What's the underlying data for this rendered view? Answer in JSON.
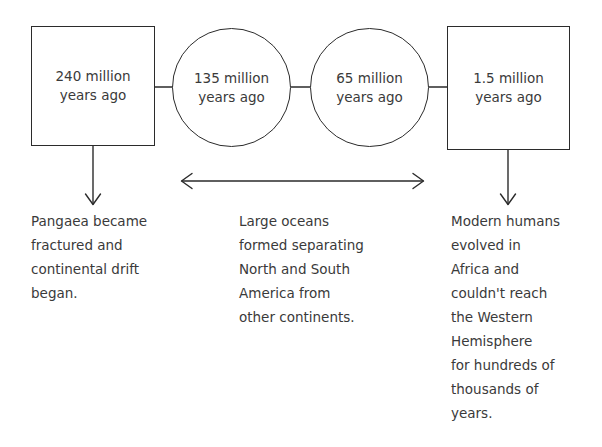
{
  "diagram": {
    "background_color": "#ffffff",
    "stroke_color": "#2b2b2b",
    "text_color": "#3a3a3a",
    "nodes": [
      {
        "id": "node-240-million",
        "shape": "box",
        "line1": "240 million",
        "line2": "years ago",
        "value": 240,
        "unit": "million years ago"
      },
      {
        "id": "node-135-million",
        "shape": "circle",
        "line1": "135 million",
        "line2": "years ago",
        "value": 135,
        "unit": "million years ago"
      },
      {
        "id": "node-65-million",
        "shape": "circle",
        "line1": "65 million",
        "line2": "years ago",
        "value": 65,
        "unit": "million years ago"
      },
      {
        "id": "node-1-5-million",
        "shape": "box",
        "line1": "1.5 million",
        "line2": "years ago",
        "value": 1.5,
        "unit": "million years ago"
      }
    ],
    "captions": {
      "left": "Pangaea became\nfractured and\ncontinental drift\nbegan.",
      "middle": "Large oceans\nformed separating\nNorth and South\nAmerica from\nother continents.",
      "right": "Modern humans\nevolved in\nAfrica and\ncouldn't reach\nthe Western\nHemisphere\nfor hundreds of\nthousands of\nyears."
    },
    "connectors": {
      "box1_to_circle1": "horizontal-connector",
      "circle1_to_circle2": "horizontal-connector",
      "circle2_to_box2": "horizontal-connector",
      "span_arrow": "double-headed-horizontal-arrow",
      "down_arrow_left": "down-arrow",
      "down_arrow_middle": "double-headed-arrow-to-caption",
      "down_arrow_right": "down-arrow"
    }
  }
}
